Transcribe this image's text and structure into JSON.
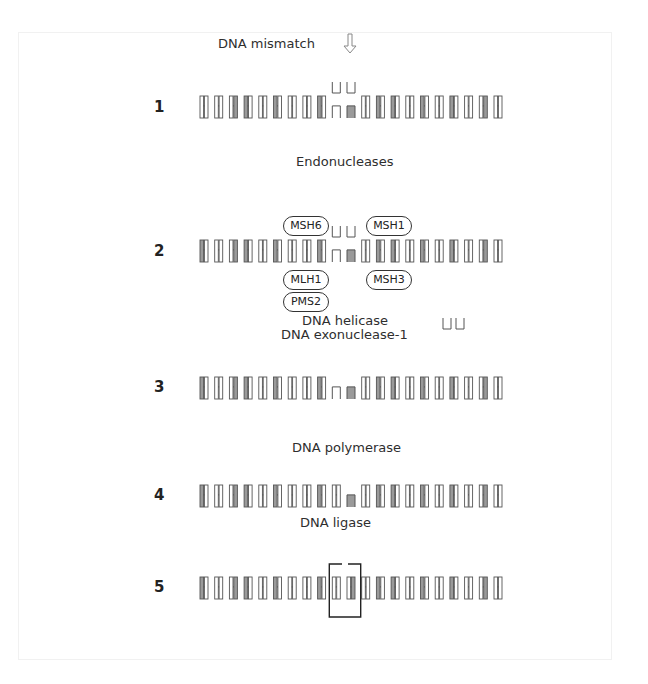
{
  "figure": {
    "colors": {
      "strand": "#555555",
      "shade": "#9a9a9a",
      "protein_border": "#333333",
      "arrow": "#888888"
    }
  },
  "step1": {
    "number": "1",
    "mismatch_label": "DNA mismatch",
    "arrow_icon": "down-arrow-outline",
    "left_pairs": [
      "0",
      "0",
      "R",
      "L",
      "0",
      "L",
      "0",
      "0",
      "L"
    ],
    "mismatch_pairs": [
      "0",
      "R"
    ],
    "right_pairs": [
      "0",
      "L",
      "L",
      "0",
      "L",
      "0",
      "L",
      "0",
      "R",
      "0"
    ],
    "enzyme_label": "Endonucleases"
  },
  "step2": {
    "number": "2",
    "left_pairs": [
      "L",
      "0",
      "R",
      "L",
      "0",
      "L",
      "0",
      "0",
      "L"
    ],
    "mismatch_pairs": [
      "0",
      "R"
    ],
    "right_pairs": [
      "0",
      "L",
      "L",
      "0",
      "L",
      "0",
      "L",
      "0",
      "R",
      "0"
    ],
    "proteins": {
      "msh6": "MSH6",
      "msh1": "MSH1",
      "mlh1": "MLH1",
      "msh3": "MSH3",
      "pms2": "PMS2"
    },
    "enzyme_label_1": "DNA helicase",
    "enzyme_label_2": "DNA exonuclease-1"
  },
  "step3": {
    "number": "3",
    "left_pairs": [
      "L",
      "0",
      "R",
      "L",
      "0",
      "L",
      "0",
      "0",
      "L"
    ],
    "gap_pairs": [
      "0",
      "R"
    ],
    "right_pairs": [
      "0",
      "L",
      "L",
      "0",
      "L",
      "0",
      "L",
      "0",
      "R",
      "0"
    ],
    "enzyme_label": "DNA polymerase"
  },
  "step4": {
    "number": "4",
    "left_pairs": [
      "L",
      "0",
      "R",
      "L",
      "0",
      "L",
      "0",
      "0",
      "L",
      "0"
    ],
    "gap_pairs": [
      "R"
    ],
    "right_pairs": [
      "0",
      "L",
      "L",
      "0",
      "L",
      "0",
      "L",
      "0",
      "R",
      "0"
    ],
    "enzyme_label": "DNA ligase"
  },
  "step5": {
    "number": "5",
    "left_pairs": [
      "L",
      "0",
      "R",
      "L",
      "0",
      "L",
      "0",
      "0",
      "L"
    ],
    "repaired_pairs": [
      "0",
      "R"
    ],
    "right_pairs": [
      "0",
      "L",
      "L",
      "0",
      "L",
      "0",
      "L",
      "0",
      "R",
      "0"
    ]
  }
}
